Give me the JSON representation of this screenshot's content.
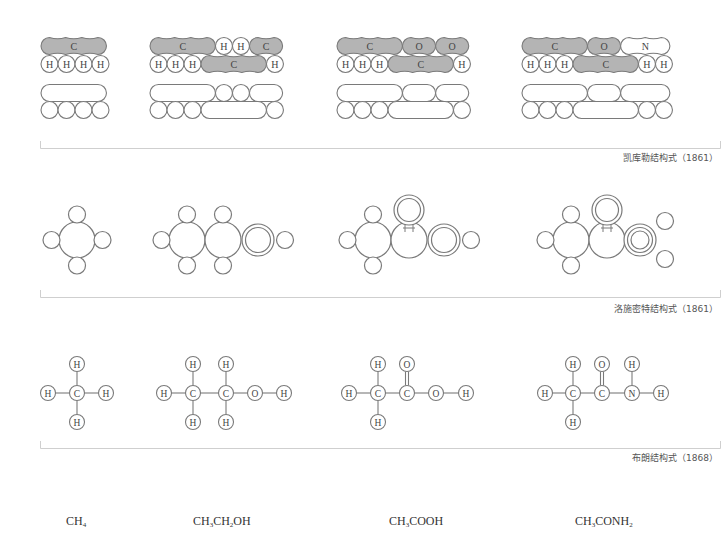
{
  "colors": {
    "stroke": "#7a7a7a",
    "shaded_fill": "#b4b4b4",
    "bracket": "#cccccc",
    "caption_text": "#555555",
    "formula_text": "#333333"
  },
  "sections": [
    {
      "id": "kekule",
      "caption": "凯库勒结构式（1861）",
      "model": "sausage"
    },
    {
      "id": "loschmidt",
      "caption": "洛施密特结构式（1861）",
      "model": "circles"
    },
    {
      "id": "brown",
      "caption": "布朗结构式（1868）",
      "model": "ball-and-line"
    }
  ],
  "molecules": [
    {
      "name": "methane",
      "formula": {
        "parts": [
          [
            "CH",
            ""
          ],
          [
            "4",
            "sub"
          ]
        ]
      }
    },
    {
      "name": "ethanol",
      "formula": {
        "parts": [
          [
            "CH",
            ""
          ],
          [
            "3",
            "sub"
          ],
          [
            "CH",
            ""
          ],
          [
            "2",
            "sub"
          ],
          [
            "OH",
            ""
          ]
        ]
      }
    },
    {
      "name": "acetic-acid",
      "formula": {
        "parts": [
          [
            "CH",
            ""
          ],
          [
            "3",
            "sub"
          ],
          [
            "COOH",
            ""
          ]
        ]
      }
    },
    {
      "name": "acetamide",
      "formula": {
        "parts": [
          [
            "CH",
            ""
          ],
          [
            "3",
            "sub"
          ],
          [
            "CONH",
            ""
          ],
          [
            "2",
            "sub"
          ]
        ]
      }
    }
  ],
  "atom_labels": {
    "H": "H",
    "C": "C",
    "O": "O",
    "N": "N"
  },
  "formulas_text": [
    "CH4",
    "CH3CH2OH",
    "CH3COOH",
    "CH3CONH2"
  ]
}
